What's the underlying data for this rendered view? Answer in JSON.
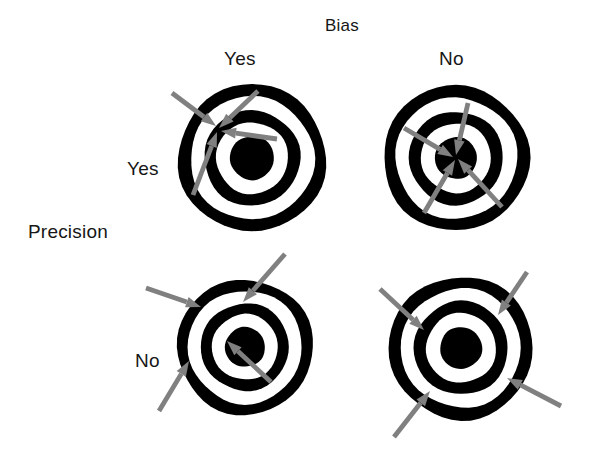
{
  "figure": {
    "title": "Bias",
    "column_axis_label": "Bias",
    "row_axis_label": "Precision",
    "columns": [
      "Yes",
      "No"
    ],
    "rows": [
      "Yes",
      "No"
    ],
    "ink_color": "#000000",
    "arrow_color": "#808080",
    "background_color": "#ffffff",
    "text_color": "#161616"
  },
  "headers": {
    "bias_title": "Bias",
    "bias_yes": "Yes",
    "bias_no": "No",
    "precision_title": "Precision",
    "precision_yes": "Yes",
    "precision_no": "No"
  },
  "chart_data": {
    "type": "scatter",
    "title": "Bias",
    "xlabel": "Bias",
    "ylabel": "Precision",
    "categories_x": [
      "Yes",
      "No"
    ],
    "categories_y": [
      "Yes",
      "No"
    ],
    "legend": [],
    "grid": false,
    "panels": [
      {
        "id": "precision-yes-bias-yes",
        "precision": "Yes",
        "bias": "Yes",
        "center": [
          252,
          158
        ],
        "outer_radius": 74,
        "rings": [
          74,
          62,
          48,
          36,
          22
        ],
        "description": "tight cluster away from bullseye",
        "hits": [
          {
            "x": 216,
            "y": 126,
            "from_x": 172,
            "from_y": 93
          },
          {
            "x": 219,
            "y": 128,
            "from_x": 258,
            "from_y": 91
          },
          {
            "x": 221,
            "y": 131,
            "from_x": 277,
            "from_y": 139
          },
          {
            "x": 217,
            "y": 132,
            "from_x": 193,
            "from_y": 195
          }
        ]
      },
      {
        "id": "precision-yes-bias-no",
        "precision": "Yes",
        "bias": "No",
        "center": [
          456,
          158
        ],
        "outer_radius": 73,
        "rings": [
          73,
          61,
          47,
          35,
          21
        ],
        "description": "tight cluster on the bullseye",
        "hits": [
          {
            "x": 453,
            "y": 157,
            "from_x": 404,
            "from_y": 128
          },
          {
            "x": 456,
            "y": 155,
            "from_x": 468,
            "from_y": 103
          },
          {
            "x": 455,
            "y": 160,
            "from_x": 424,
            "from_y": 213
          },
          {
            "x": 458,
            "y": 159,
            "from_x": 502,
            "from_y": 207
          }
        ]
      },
      {
        "id": "precision-no-bias-yes",
        "precision": "No",
        "bias": "Yes",
        "center": [
          245,
          347
        ],
        "outer_radius": 68,
        "rings": [
          68,
          57,
          44,
          33,
          20
        ],
        "description": "scattered hits biased to the upper left",
        "hits": [
          {
            "x": 201,
            "y": 307,
            "from_x": 146,
            "from_y": 288
          },
          {
            "x": 243,
            "y": 302,
            "from_x": 285,
            "from_y": 254
          },
          {
            "x": 189,
            "y": 361,
            "from_x": 159,
            "from_y": 411
          },
          {
            "x": 227,
            "y": 341,
            "from_x": 271,
            "from_y": 382
          }
        ]
      },
      {
        "id": "precision-no-bias-no",
        "precision": "No",
        "bias": "No",
        "center": [
          461,
          348
        ],
        "outer_radius": 72,
        "rings": [
          72,
          60,
          47,
          35,
          21
        ],
        "description": "scattered hits spread evenly around the bullseye",
        "hits": [
          {
            "x": 424,
            "y": 330,
            "from_x": 380,
            "from_y": 289
          },
          {
            "x": 498,
            "y": 315,
            "from_x": 527,
            "from_y": 272
          },
          {
            "x": 430,
            "y": 391,
            "from_x": 394,
            "from_y": 437
          },
          {
            "x": 507,
            "y": 378,
            "from_x": 561,
            "from_y": 406
          }
        ]
      }
    ]
  }
}
